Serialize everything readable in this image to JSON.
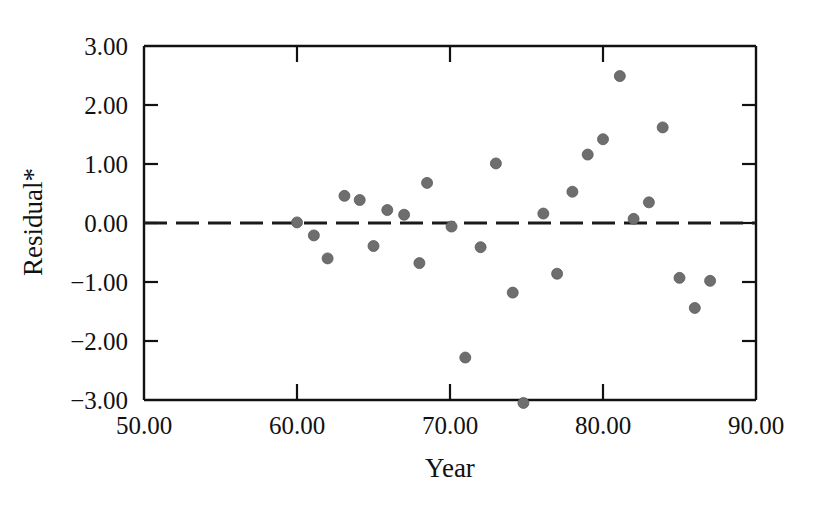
{
  "chart_data": {
    "type": "scatter",
    "title": "",
    "xlabel": "Year",
    "ylabel": "Residual*",
    "xlim": [
      50,
      90
    ],
    "ylim": [
      -3.0,
      3.0
    ],
    "grid": false,
    "legend": null,
    "x_ticks": [
      50,
      60,
      70,
      80,
      90
    ],
    "x_tick_labels": [
      "50.00",
      "60.00",
      "70.00",
      "80.00",
      "90.00"
    ],
    "y_ticks": [
      3,
      2,
      1,
      0,
      -1,
      -2,
      -3
    ],
    "y_tick_labels": [
      "3.00",
      "2.00",
      "1.00",
      "0.00",
      "−1.00",
      "−2.00",
      "−3.00"
    ],
    "reference_line": {
      "name": "zero-residual-line",
      "y": 0.0,
      "style": "dashed",
      "color": "#1a1a1a"
    },
    "marker": {
      "shape": "circle",
      "size": 11,
      "color": "#6e6e6e",
      "edge_color": "#5a5a5a"
    },
    "points": [
      {
        "x": 60.0,
        "y": 0.01
      },
      {
        "x": 61.1,
        "y": -0.21
      },
      {
        "x": 62.0,
        "y": -0.6
      },
      {
        "x": 63.1,
        "y": 0.46
      },
      {
        "x": 64.1,
        "y": 0.39
      },
      {
        "x": 65.0,
        "y": -0.39
      },
      {
        "x": 65.9,
        "y": 0.22
      },
      {
        "x": 67.0,
        "y": 0.14
      },
      {
        "x": 68.0,
        "y": -0.68
      },
      {
        "x": 68.5,
        "y": 0.68
      },
      {
        "x": 70.1,
        "y": -0.06
      },
      {
        "x": 71.0,
        "y": -2.28
      },
      {
        "x": 72.0,
        "y": -0.41
      },
      {
        "x": 73.0,
        "y": 1.01
      },
      {
        "x": 74.1,
        "y": -1.18
      },
      {
        "x": 74.8,
        "y": -3.05
      },
      {
        "x": 76.1,
        "y": 0.16
      },
      {
        "x": 77.0,
        "y": -0.86
      },
      {
        "x": 78.0,
        "y": 0.53
      },
      {
        "x": 79.0,
        "y": 1.16
      },
      {
        "x": 80.0,
        "y": 1.42
      },
      {
        "x": 81.1,
        "y": 2.49
      },
      {
        "x": 82.0,
        "y": 0.07
      },
      {
        "x": 83.0,
        "y": 0.35
      },
      {
        "x": 83.9,
        "y": 1.62
      },
      {
        "x": 85.0,
        "y": -0.93
      },
      {
        "x": 86.0,
        "y": -1.44
      },
      {
        "x": 87.0,
        "y": -0.98
      }
    ]
  },
  "axes": {
    "x_title": "Year",
    "y_title": "Residual*"
  }
}
